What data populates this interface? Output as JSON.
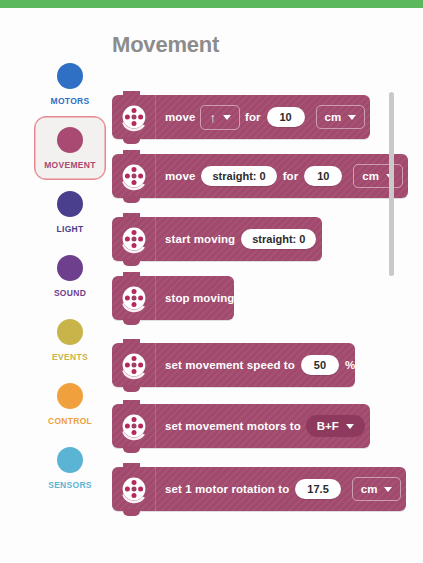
{
  "window": {
    "top_accent_color": "#5cb85c",
    "background_color": "#ffffff"
  },
  "palette": {
    "title": "Movement",
    "title_color": "#8c8c8c",
    "block_color": "#a14a6e"
  },
  "sidebar": {
    "items": [
      {
        "label": "MOTORS",
        "color": "#2f6fc4",
        "selected": false
      },
      {
        "label": "MOVEMENT",
        "color": "#a84a72",
        "selected": true
      },
      {
        "label": "LIGHT",
        "color": "#4a3f8c",
        "selected": false
      },
      {
        "label": "SOUND",
        "color": "#6e3f8c",
        "selected": false
      },
      {
        "label": "EVENTS",
        "color": "#c9b44a",
        "selected": false
      },
      {
        "label": "CONTROL",
        "color": "#f0a03c",
        "selected": false
      },
      {
        "label": "SENSORS",
        "color": "#5cb4d4",
        "selected": false
      }
    ]
  },
  "blocks": [
    {
      "id": "move-direction-for",
      "icon": "hub-icon",
      "parts": [
        {
          "type": "text",
          "value": "move"
        },
        {
          "type": "dropdown",
          "value": "↑",
          "style": "outline"
        },
        {
          "type": "text",
          "value": "for"
        },
        {
          "type": "input",
          "value": "10"
        },
        {
          "type": "dropdown",
          "value": "cm",
          "style": "outline"
        }
      ]
    },
    {
      "id": "move-steering-for",
      "icon": "hub-icon",
      "parts": [
        {
          "type": "text",
          "value": "move"
        },
        {
          "type": "input",
          "value": "straight: 0"
        },
        {
          "type": "text",
          "value": "for"
        },
        {
          "type": "input",
          "value": "10"
        },
        {
          "type": "dropdown",
          "value": "cm",
          "style": "outline"
        }
      ]
    },
    {
      "id": "start-moving",
      "icon": "hub-icon",
      "parts": [
        {
          "type": "text",
          "value": "start moving"
        },
        {
          "type": "input",
          "value": "straight: 0"
        }
      ]
    },
    {
      "id": "stop-moving",
      "icon": "hub-icon",
      "parts": [
        {
          "type": "text",
          "value": "stop moving"
        }
      ]
    },
    {
      "id": "set-movement-speed",
      "icon": "hub-icon",
      "parts": [
        {
          "type": "text",
          "value": "set movement speed to"
        },
        {
          "type": "input",
          "value": "50"
        },
        {
          "type": "text",
          "value": "%"
        }
      ]
    },
    {
      "id": "set-movement-motors",
      "icon": "hub-icon",
      "parts": [
        {
          "type": "text",
          "value": "set movement motors to"
        },
        {
          "type": "dropdown",
          "value": "B+F",
          "style": "pill"
        }
      ]
    },
    {
      "id": "set-motor-rotation",
      "icon": "hub-icon",
      "parts": [
        {
          "type": "text",
          "value": "set 1 motor rotation to"
        },
        {
          "type": "input",
          "value": "17.5"
        },
        {
          "type": "dropdown",
          "value": "cm",
          "style": "outline"
        }
      ]
    }
  ],
  "scrollbar": {
    "orientation": "vertical",
    "color": "#c9c9c9"
  }
}
